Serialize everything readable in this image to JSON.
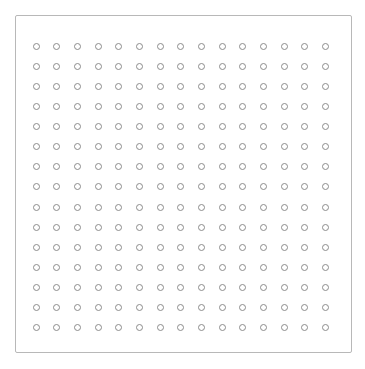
{
  "panel": {
    "name": "dot-grid-panel",
    "background_color": "#ffffff",
    "border_color": "#b8b8b8",
    "border_width_px": 1,
    "border_radius_px": 2,
    "left_px": 15,
    "top_px": 15,
    "width_px": 337,
    "height_px": 338,
    "title": "",
    "label": ""
  },
  "canvas": {
    "background_color": "#ffffff",
    "width_px": 365,
    "height_px": 369
  },
  "grid": {
    "columns": 15,
    "rows": 15,
    "total_dots": 225,
    "column_spacing_px": 21.4,
    "row_spacing_px": 20.8,
    "first_dot_center_x_px": 31,
    "first_dot_center_y_px": 41,
    "last_dot_center_x_px": 331,
    "last_dot_center_y_px": 332,
    "inset_left_px": 10,
    "inset_top_px": 20,
    "inset_right_px": 15,
    "inset_bottom_px": 14
  },
  "dot": {
    "icon_name": "circle-outline-icon",
    "diameter_px": 7,
    "stroke_width_px": 1,
    "stroke_color": "#8c8c8c",
    "fill_color": "transparent",
    "shape": "circle"
  },
  "text": {
    "header_title": "",
    "status_text": "",
    "footer_text": ""
  }
}
